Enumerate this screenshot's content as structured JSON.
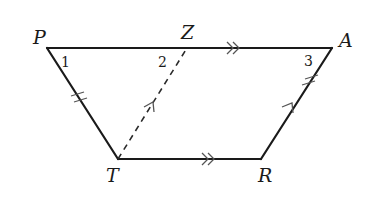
{
  "figure": {
    "type": "trapezoid-geometry-diagram",
    "vertices": {
      "P": {
        "label": "P",
        "x": 47,
        "y": 48
      },
      "Z": {
        "label": "Z",
        "x": 187,
        "y": 48
      },
      "A": {
        "label": "A",
        "x": 332,
        "y": 48
      },
      "T": {
        "label": "T",
        "x": 118,
        "y": 159
      },
      "R": {
        "label": "R",
        "x": 261,
        "y": 159
      }
    },
    "angles": [
      {
        "label": "1",
        "at": "P"
      },
      {
        "label": "2",
        "at": "Z"
      },
      {
        "label": "3",
        "at": "A"
      }
    ],
    "segments": [
      {
        "from": "P",
        "to": "A",
        "style": "solid",
        "mark": "double-arrow"
      },
      {
        "from": "T",
        "to": "R",
        "style": "solid",
        "mark": "double-arrow"
      },
      {
        "from": "P",
        "to": "T",
        "style": "solid",
        "mark": "double-tick"
      },
      {
        "from": "R",
        "to": "A",
        "style": "solid",
        "mark": "single-arrow+double-tick"
      },
      {
        "from": "T",
        "to": "Z",
        "style": "dashed",
        "mark": "single-arrow"
      }
    ],
    "colors": {
      "line": "#1a1a1a",
      "marks": "#555555",
      "background": "#ffffff"
    }
  }
}
